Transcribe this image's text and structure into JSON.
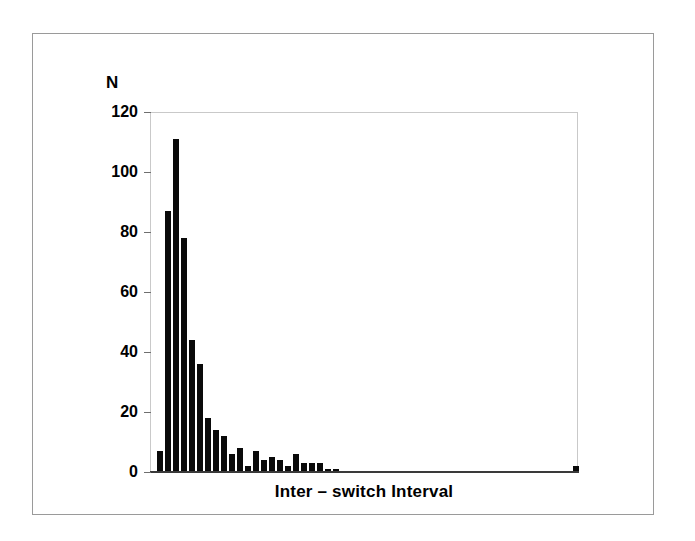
{
  "figure": {
    "background_color": "#ffffff",
    "border_color": "#9a9a9a",
    "bar_color": "#0a0a0a",
    "axis_color": "#3a3a3a"
  },
  "chart_data": {
    "type": "bar",
    "title": "",
    "subtitle": "",
    "xlabel": "Inter – switch Interval",
    "ylabel": "N",
    "ylim": [
      0,
      120
    ],
    "yticks": [
      0,
      20,
      40,
      60,
      80,
      100,
      120
    ],
    "ytick_labels": [
      "0",
      "20",
      "40",
      "60",
      "80",
      "100",
      "120"
    ],
    "grid": false,
    "legend": null,
    "legend_position": "none",
    "xtick_labels": [],
    "x_axis_note": "Histogram bin index; x tick labels are not printed on the figure.",
    "bin_indices": [
      1,
      2,
      3,
      4,
      5,
      6,
      7,
      8,
      9,
      10,
      11,
      12,
      13,
      14,
      15,
      16,
      17,
      18,
      19,
      20,
      21,
      22,
      23,
      24,
      25,
      26,
      27,
      28,
      29,
      30,
      31,
      32,
      33,
      34,
      35,
      36,
      37,
      38,
      39,
      40,
      41,
      42,
      43,
      44,
      45,
      46,
      47,
      48,
      49,
      50,
      51,
      52,
      53
    ],
    "values": [
      7,
      87,
      111,
      78,
      44,
      36,
      18,
      14,
      12,
      6,
      8,
      2,
      7,
      4,
      5,
      4,
      2,
      6,
      3,
      3,
      3,
      1,
      1,
      0,
      0,
      0,
      0,
      0,
      0,
      0,
      0,
      0,
      0,
      0,
      0,
      0,
      0,
      0,
      0,
      0,
      0,
      0,
      0,
      0,
      0,
      0,
      0,
      0,
      0,
      0,
      0,
      0,
      2
    ],
    "values_note": "Counts read off the y axis (0-120, ticks every 20). A single isolated bar of ~2 appears far to the right in the tail.",
    "peak": {
      "bin": 3,
      "value": 111
    },
    "n_bins_drawn": 53,
    "bar_pitch_px": 8,
    "bar_width_px": 7
  },
  "labels": {
    "y_axis_title": "N",
    "x_axis_title": "Inter – switch Interval"
  }
}
